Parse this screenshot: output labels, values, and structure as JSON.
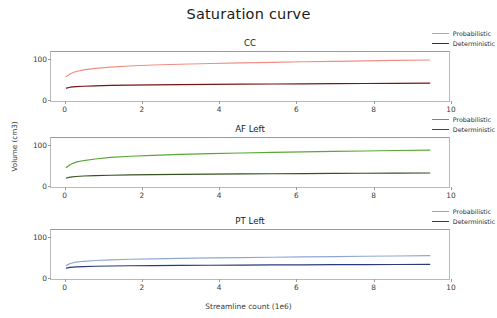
{
  "figure": {
    "title": "Saturation curve",
    "xlabel": "Streamline count (1e6)",
    "ylabel": "Volume (cm3)"
  },
  "panels": [
    {
      "title": "CC",
      "legend": [
        {
          "label": "Probabilistic",
          "color": "#f08e84"
        },
        {
          "label": "Deterministic",
          "color": "#741616"
        }
      ]
    },
    {
      "title": "AF Left",
      "legend": [
        {
          "label": "Probabilistic",
          "color": "#5aa736"
        },
        {
          "label": "Deterministic",
          "color": "#35521f"
        }
      ]
    },
    {
      "title": "PT Left",
      "legend": [
        {
          "label": "Probabilistic",
          "color": "#8fa7d6"
        },
        {
          "label": "Deterministic",
          "color": "#2b3a80"
        }
      ]
    }
  ],
  "axis": {
    "xticks": [
      "0",
      "2",
      "4",
      "6",
      "8",
      "10"
    ],
    "yticks": [
      "0",
      "100"
    ]
  },
  "chart_data": {
    "type": "line",
    "title": "Saturation curve",
    "xlabel": "Streamline count (1e6)",
    "ylabel": "Volume (cm3)",
    "xlim": [
      -0.35,
      10.0
    ],
    "ylim": [
      -8,
      118
    ],
    "xticks": [
      0,
      2,
      4,
      6,
      8,
      10
    ],
    "yticks": [
      0,
      100
    ],
    "grid": false,
    "legend_position": "upper right outside",
    "subplots": [
      {
        "title": "CC",
        "series": [
          {
            "name": "Probabilistic",
            "color": "#f08e84",
            "x": [
              0.05,
              0.15,
              0.3,
              0.5,
              0.8,
              1.2,
              1.7,
              2.3,
              3.0,
              3.8,
              4.6,
              5.4,
              6.2,
              7.0,
              7.8,
              8.6,
              9.5
            ],
            "values": [
              55,
              62,
              68,
              72,
              76,
              79,
              82,
              84.5,
              86.5,
              88.5,
              90,
              91.5,
              92.8,
              94,
              95.2,
              96.3,
              97.5
            ]
          },
          {
            "name": "Deterministic",
            "color": "#741616",
            "x": [
              0.05,
              0.15,
              0.3,
              0.5,
              0.8,
              1.2,
              1.7,
              2.3,
              3.0,
              3.8,
              4.6,
              5.4,
              6.2,
              7.0,
              7.8,
              8.6,
              9.5
            ],
            "values": [
              25,
              27.5,
              29,
              30,
              31,
              32,
              32.8,
              33.5,
              34.2,
              34.8,
              35.3,
              35.8,
              36.2,
              36.6,
              37.0,
              37.4,
              37.8
            ]
          }
        ]
      },
      {
        "title": "AF Left",
        "series": [
          {
            "name": "Probabilistic",
            "color": "#5aa736",
            "x": [
              0.05,
              0.15,
              0.3,
              0.5,
              0.8,
              1.2,
              1.7,
              2.3,
              3.0,
              3.8,
              4.6,
              5.4,
              6.2,
              7.0,
              7.8,
              8.6,
              9.5
            ],
            "values": [
              42,
              50,
              56,
              60,
              64,
              68,
              71,
              73.5,
              76,
              78,
              79.5,
              81,
              82.3,
              83.5,
              84.7,
              85.8,
              87
            ]
          },
          {
            "name": "Deterministic",
            "color": "#35521f",
            "x": [
              0.05,
              0.15,
              0.3,
              0.5,
              0.8,
              1.2,
              1.7,
              2.3,
              3.0,
              3.8,
              4.6,
              5.4,
              6.2,
              7.0,
              7.8,
              8.6,
              9.5
            ],
            "values": [
              15,
              17.5,
              19,
              20.2,
              21.3,
              22.3,
              23.1,
              23.8,
              24.5,
              25.1,
              25.6,
              26.1,
              26.5,
              26.9,
              27.3,
              27.7,
              28.1
            ]
          }
        ]
      },
      {
        "title": "PT Left",
        "series": [
          {
            "name": "Probabilistic",
            "color": "#8fa7d6",
            "x": [
              0.05,
              0.15,
              0.3,
              0.5,
              0.8,
              1.2,
              1.7,
              2.3,
              3.0,
              3.8,
              4.6,
              5.4,
              6.2,
              7.0,
              7.8,
              8.6,
              9.5
            ],
            "values": [
              27,
              32,
              35.5,
              37.5,
              39.5,
              41.2,
              42.7,
              43.9,
              45.1,
              46.2,
              47.1,
              48.0,
              48.8,
              49.6,
              50.4,
              51.1,
              52.0
            ]
          },
          {
            "name": "Deterministic",
            "color": "#2b3a80",
            "x": [
              0.05,
              0.15,
              0.3,
              0.5,
              0.8,
              1.2,
              1.7,
              2.3,
              3.0,
              3.8,
              4.6,
              5.4,
              6.2,
              7.0,
              7.8,
              8.6,
              9.5
            ],
            "values": [
              20,
              22,
              23.2,
              24.0,
              24.8,
              25.4,
              26.0,
              26.5,
              27.0,
              27.4,
              27.8,
              28.2,
              28.5,
              28.8,
              29.1,
              29.4,
              29.7
            ]
          }
        ]
      }
    ]
  }
}
